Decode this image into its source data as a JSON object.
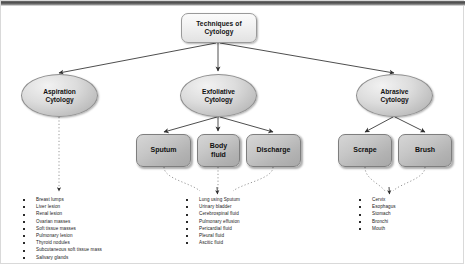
{
  "diagram": {
    "root": {
      "label": "Techniques of\nCytology",
      "line1": "Techniques of",
      "line2": "Cytology"
    },
    "branches": [
      {
        "id": "aspiration",
        "line1": "Aspiration",
        "line2": "Cytology"
      },
      {
        "id": "exfoliative",
        "line1": "Exfoliative",
        "line2": "Cytology"
      },
      {
        "id": "abrasive",
        "line1": "Abrasive",
        "line2": "Cytology"
      }
    ],
    "leaves": [
      {
        "id": "sputum",
        "line1": "Sputum",
        "line2": ""
      },
      {
        "id": "body-fluid",
        "line1": "Body",
        "line2": "fluid"
      },
      {
        "id": "discharge",
        "line1": "Discharge",
        "line2": ""
      },
      {
        "id": "scrape",
        "line1": "Scrape",
        "line2": ""
      },
      {
        "id": "brush",
        "line1": "Brush",
        "line2": ""
      }
    ],
    "lists": {
      "aspiration": [
        "Breast lumps",
        "Liver lesion",
        "Renal lesion",
        "Ovarian masses",
        "Soft tissue masses",
        "Pulmonary lesion",
        "Thyroid nodules",
        "Subcutaneous soft tissue mass",
        "Salivary glands"
      ],
      "exfoliative": [
        "Lung using Sputum",
        "Urinary bladder",
        "Cerebrospinal fluid",
        "Pulmonary effusion",
        "Pericardial fluid",
        "Pleural fluid",
        "Ascitic fluid"
      ],
      "abrasive": [
        "Cervix",
        "Esophagus",
        "Stomach",
        "Bronchi",
        "Mouth"
      ]
    },
    "colors": {
      "background": "#ffffff",
      "node_fill_light": "#eeeeee",
      "node_fill_dark": "#b5b5b5",
      "stroke": "#3a3a3a",
      "text": "#111111",
      "topbar": "#4a4a4a"
    }
  }
}
